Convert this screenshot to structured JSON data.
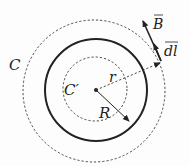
{
  "diagram": {
    "labels": {
      "outer_loop": "C",
      "inner_loop": "C′",
      "radius_r": "r",
      "radius_R": "R",
      "field": "B",
      "element": "dl"
    },
    "geometry": {
      "center": [
        96,
        90
      ],
      "solid_circle_radius": 51,
      "inner_dashed_radius": 32,
      "outer_dashed_radius": 71
    },
    "colors": {
      "stroke": "#222222",
      "background": "#fdfdfd"
    }
  }
}
